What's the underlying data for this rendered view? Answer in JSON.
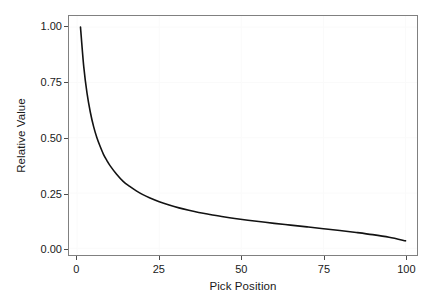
{
  "chart_data": {
    "type": "line",
    "title": "",
    "subtitle": "",
    "xlabel": "Pick Position",
    "ylabel": "Relative Value",
    "xlim": [
      -2.5,
      103.5
    ],
    "ylim": [
      -0.03,
      1.05
    ],
    "xticks": [
      0,
      25,
      50,
      75,
      100
    ],
    "xticklabels": [
      "0",
      "25",
      "50",
      "75",
      "100"
    ],
    "yticks": [
      0.0,
      0.25,
      0.5,
      0.75,
      1.0
    ],
    "yticklabels": [
      "0.00",
      "0.25",
      "0.50",
      "0.75",
      "1.00"
    ],
    "grid": true,
    "legend": false,
    "legend_position": "none",
    "panel_border_color": "#808080",
    "line_color": "#121212",
    "background_color": "#ffffff",
    "series": [
      {
        "name": "Relative Value",
        "x": [
          1,
          2,
          3,
          4,
          5,
          6,
          7,
          8,
          9,
          10,
          12,
          14,
          16,
          18,
          20,
          22,
          25,
          28,
          31,
          34,
          37,
          40,
          44,
          48,
          52,
          56,
          60,
          65,
          70,
          75,
          80,
          85,
          90,
          95,
          100
        ],
        "values": [
          1.0,
          0.82,
          0.7,
          0.615,
          0.55,
          0.5,
          0.46,
          0.425,
          0.398,
          0.374,
          0.335,
          0.303,
          0.28,
          0.26,
          0.243,
          0.229,
          0.211,
          0.196,
          0.183,
          0.172,
          0.162,
          0.154,
          0.144,
          0.135,
          0.127,
          0.12,
          0.113,
          0.105,
          0.097,
          0.089,
          0.081,
          0.072,
          0.062,
          0.05,
          0.034
        ]
      }
    ]
  }
}
